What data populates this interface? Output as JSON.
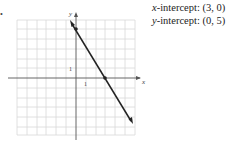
{
  "graph": {
    "axis_labels": {
      "x": "x",
      "y": "y"
    },
    "tick_labels": {
      "x_unit": "1",
      "y_unit": "1"
    },
    "grid": {
      "x_range": [
        -6,
        6
      ],
      "y_range": [
        -6,
        6
      ]
    },
    "line": {
      "points": [
        [
          3,
          0
        ],
        [
          0,
          5
        ]
      ],
      "equation": "5x + 3y = 15"
    },
    "colors": {
      "grid": "#d8d8d8",
      "axes": "#555555",
      "line": "#222222"
    }
  },
  "info": {
    "x_intercept_label": "x",
    "x_intercept_text": "-intercept: (3, 0)",
    "y_intercept_label": "y",
    "y_intercept_text": "-intercept: (0, 5)"
  }
}
